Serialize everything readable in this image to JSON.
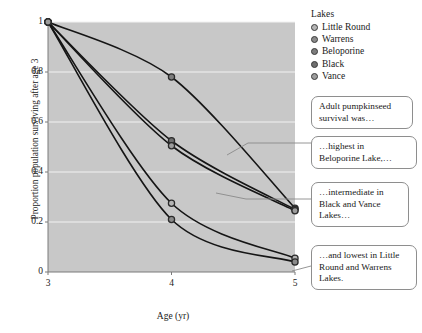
{
  "chart_data": {
    "type": "line",
    "title": "",
    "xlabel": "Age (yr)",
    "ylabel": "Proportion population surviving after age 3",
    "x": [
      3,
      4,
      5
    ],
    "xlim": [
      3,
      5
    ],
    "ylim": [
      0,
      1
    ],
    "xticks": [
      "3",
      "4",
      "5"
    ],
    "yticks": [
      "0",
      "0.2",
      "0.4",
      "0.6",
      "0.8",
      "1"
    ],
    "grid": "horizontal-white",
    "legend_position": "right-top",
    "legend_title": "Lakes",
    "series": [
      {
        "name": "Little Round",
        "values": [
          1,
          0.275,
          0.055
        ],
        "color": "#b4b4b4"
      },
      {
        "name": "Warrens",
        "values": [
          1,
          0.21,
          0.04
        ],
        "color": "#8a8a8a"
      },
      {
        "name": "Beloporine",
        "values": [
          1,
          0.78,
          0.255
        ],
        "color": "#7d7d7d"
      },
      {
        "name": "Black",
        "values": [
          1,
          0.525,
          0.25
        ],
        "color": "#6e6e6e"
      },
      {
        "name": "Vance",
        "values": [
          1,
          0.505,
          0.245
        ],
        "color": "#9c9c9c"
      }
    ]
  },
  "legend": {
    "title": "Lakes",
    "items": [
      {
        "label": "Little Round"
      },
      {
        "label": "Warrens"
      },
      {
        "label": "Beloporine"
      },
      {
        "label": "Black"
      },
      {
        "label": "Vance"
      }
    ]
  },
  "axes": {
    "x_title": "Age (yr)",
    "y_title": "Proportion population surviving after age 3",
    "x_ticks": [
      "3",
      "4",
      "5"
    ],
    "y_ticks": [
      "1",
      "0.8",
      "0.6",
      "0.4",
      "0.2",
      "0"
    ]
  },
  "callouts": [
    {
      "lines": [
        "Adult pumpkinseed",
        "survival was…"
      ]
    },
    {
      "lines": [
        "…highest in",
        "Beloporine Lake,…"
      ]
    },
    {
      "lines": [
        "…intermediate in",
        "Black and Vance",
        "Lakes…"
      ]
    },
    {
      "lines": [
        "…and lowest in Little",
        "Round and Warrens",
        "Lakes."
      ]
    }
  ],
  "colors": {
    "plot_background": "#c8c8c8",
    "gridline": "#f2f2f2",
    "line": "#151515",
    "callout_border": "#8e8e8e",
    "page_background": "#ffffff"
  }
}
